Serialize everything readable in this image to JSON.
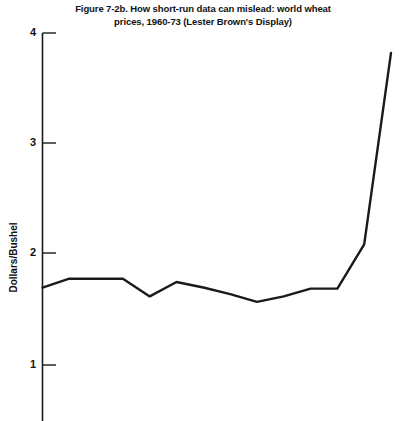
{
  "chart_data": {
    "type": "line",
    "title": "Figure 7-2b. How short-run data can mislead: world wheat prices, 1960-73 (Lester Brown's Display)",
    "title_line1": "Figure 7-2b. How short-run data can mislead: world wheat",
    "title_line2": "prices, 1960-73 (Lester Brown's Display)",
    "xlabel": "",
    "ylabel": "Dollars/Bushel",
    "ylim": [
      0.45,
      4.0
    ],
    "xlim": [
      1960,
      1973
    ],
    "yticks": [
      4,
      3,
      2,
      1
    ],
    "ytick_labels": [
      "4",
      "3",
      "2",
      "1"
    ],
    "grid": false,
    "legend": false,
    "line_color": "#1a1a1a",
    "x": [
      1960,
      1961,
      1962,
      1963,
      1964,
      1965,
      1966,
      1967,
      1968,
      1969,
      1970,
      1971,
      1972,
      1973
    ],
    "values": [
      1.7,
      1.78,
      1.78,
      1.78,
      1.62,
      1.75,
      1.7,
      1.64,
      1.57,
      1.62,
      1.69,
      1.69,
      2.09,
      3.82
    ],
    "series": [
      {
        "name": "World wheat price",
        "values": [
          1.7,
          1.78,
          1.78,
          1.78,
          1.62,
          1.75,
          1.7,
          1.64,
          1.57,
          1.62,
          1.69,
          1.69,
          2.09,
          3.82
        ]
      }
    ]
  },
  "axis": {
    "tick_4": "4",
    "tick_3": "3",
    "tick_2": "2",
    "tick_1": "1"
  }
}
